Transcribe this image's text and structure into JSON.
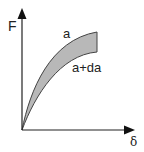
{
  "diagram": {
    "type": "force-displacement curves",
    "y_axis_label": "F",
    "x_axis_label": "δ",
    "curves": [
      {
        "label": "a",
        "position": "upper"
      },
      {
        "label": "a+da",
        "position": "lower"
      }
    ],
    "colors": {
      "axis": "#222222",
      "band_fill": "#b8b8b8",
      "band_stroke": "#444444",
      "background": "#ffffff"
    }
  }
}
